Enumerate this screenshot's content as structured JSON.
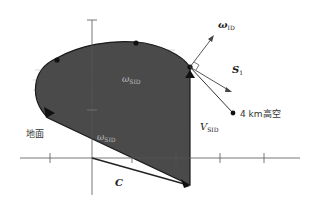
{
  "diagram": {
    "labels": {
      "omega": {
        "main": "ω",
        "sub": "ID"
      },
      "s": {
        "main": "S",
        "sub": "1"
      },
      "altitude": "4 km高空",
      "ground": "地面",
      "v": {
        "main": "V",
        "sub": "SID"
      },
      "c": "C",
      "inner_top": {
        "main": "ω",
        "sub": "SID"
      },
      "inner_bottom": {
        "main": "ω",
        "sub": "SID"
      }
    },
    "colors": {
      "fill": "#4a4a4a",
      "stroke": "#1a1a1a",
      "axis": "#555555",
      "background": "#ffffff"
    },
    "axes": {
      "horizontal_ticks": 6,
      "origin_note": "axes cross at origin"
    }
  }
}
